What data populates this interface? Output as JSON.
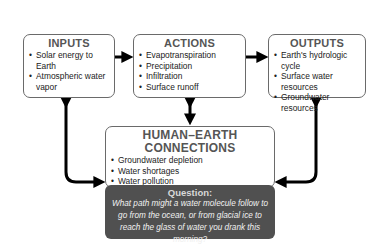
{
  "diagram": {
    "inputs": {
      "title": "INPUTS",
      "items": [
        "Solar energy to Earth",
        "Atmospheric water vapor"
      ]
    },
    "actions": {
      "title": "ACTIONS",
      "items": [
        "Evapotranspiration",
        "Precipitation",
        "Infiltration",
        "Surface runoff"
      ]
    },
    "outputs": {
      "title": "OUTPUTS",
      "items": [
        "Earth's hydrologic cycle",
        "Surface water resources",
        "Groundwater resources"
      ]
    },
    "human_earth": {
      "title": "HUMAN–EARTH CONNECTIONS",
      "items": [
        "Groundwater depletion",
        "Water shortages",
        "Water pollution",
        "Climate change"
      ]
    },
    "question": {
      "title": "Question:",
      "text": "What path might a water molecule follow to go from the ocean, or from glacial ice to reach the glass of water you drank this morning?"
    },
    "colors": {
      "box_border": "#6a6a6a",
      "title_text": "#555555",
      "question_bg": "#505050",
      "arrow": "#000000"
    }
  }
}
